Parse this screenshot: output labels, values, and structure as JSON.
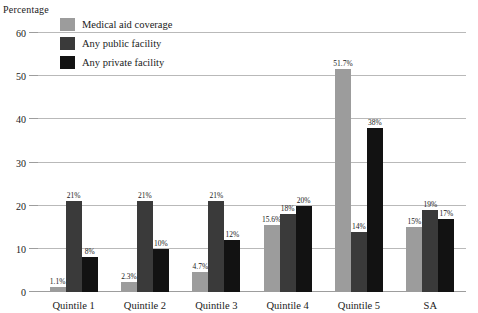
{
  "chart_data": {
    "type": "bar",
    "title": "",
    "xlabel": "",
    "ylabel": "Percentage",
    "ylim": [
      0,
      60
    ],
    "yticks": [
      0,
      10,
      20,
      30,
      40,
      50,
      60
    ],
    "grid": true,
    "legend_position": "inside-top-left",
    "categories": [
      "Quintile 1",
      "Quintile 2",
      "Quintile 3",
      "Quintile 4",
      "Quintile 5",
      "SA"
    ],
    "series": [
      {
        "name": "Medical aid coverage",
        "color": "#9c9c9c",
        "values": [
          1.1,
          2.3,
          4.7,
          15.6,
          51.7,
          15
        ],
        "labels": [
          "1.1%",
          "2.3%",
          "4.7%",
          "15.6%",
          "51.7%",
          "15%"
        ]
      },
      {
        "name": "Any public facility",
        "color": "#3a3a3a",
        "values": [
          21,
          21,
          21,
          18,
          14,
          19
        ],
        "labels": [
          "21%",
          "21%",
          "21%",
          "18%",
          "14%",
          "19%"
        ]
      },
      {
        "name": "Any private facility",
        "color": "#121212",
        "values": [
          8,
          10,
          12,
          20,
          38,
          17
        ],
        "labels": [
          "8%",
          "10%",
          "12%",
          "20%",
          "38%",
          "17%"
        ]
      }
    ]
  },
  "axis": {
    "y_title": "Percentage",
    "tick_labels": [
      "60",
      "50",
      "40",
      "30",
      "20",
      "10",
      "0"
    ]
  },
  "legend": {
    "items": [
      {
        "label": "Medical aid coverage",
        "color": "#9c9c9c"
      },
      {
        "label": "Any public facility",
        "color": "#3a3a3a"
      },
      {
        "label": "Any private facility",
        "color": "#121212"
      }
    ]
  },
  "colors": {
    "gridline": "#b9b9b9",
    "baseline": "#9d9d9d",
    "background": "#ffffff",
    "text": "#1a1a1a"
  }
}
